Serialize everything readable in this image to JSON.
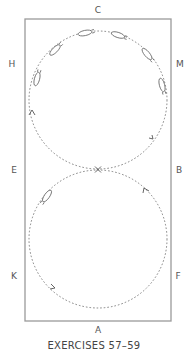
{
  "diagram": {
    "type": "dressage-arena-figure-eight",
    "colors": {
      "border": "#9a9a9a",
      "path": "#666666",
      "text": "#555555",
      "horse_fill": "#ffffff",
      "horse_stroke": "#666666"
    },
    "arena": {
      "x": 25,
      "y": 19,
      "width": 146,
      "height": 302
    },
    "markers": {
      "C": "C",
      "H": "H",
      "M": "M",
      "E": "E",
      "B": "B",
      "K": "K",
      "F": "F",
      "A": "A"
    },
    "center_point": {
      "label": "X"
    },
    "circles": [
      {
        "name": "upper-circle",
        "cx": 98,
        "cy": 100,
        "r": 69
      },
      {
        "name": "lower-circle",
        "cx": 98,
        "cy": 239,
        "r": 69
      }
    ],
    "caption": "EXERCISES 57–59"
  }
}
